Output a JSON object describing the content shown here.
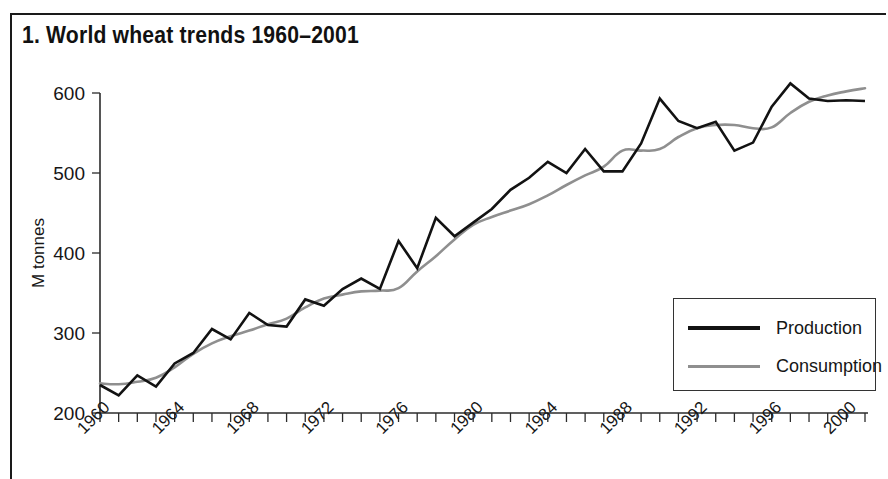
{
  "figure": {
    "title": "1. World wheat trends 1960–2001",
    "border_color": "#1a1a1a",
    "background": "#ffffff"
  },
  "legend": {
    "position": "bottom-right",
    "entries": [
      {
        "label": "Production",
        "color": "#121212",
        "style": "solid"
      },
      {
        "label": "Consumption",
        "color": "#8f8f8f",
        "style": "solid"
      }
    ]
  },
  "chart_data": {
    "type": "line",
    "title": "1. World wheat trends 1960–2001",
    "xlabel": "",
    "ylabel": "M tonnes",
    "xlim": [
      1960,
      2001
    ],
    "ylim": [
      200,
      600
    ],
    "yticks": [
      200,
      300,
      400,
      500,
      600
    ],
    "grid": false,
    "x": [
      1960,
      1961,
      1962,
      1963,
      1964,
      1965,
      1966,
      1967,
      1968,
      1969,
      1970,
      1971,
      1972,
      1973,
      1974,
      1975,
      1976,
      1977,
      1978,
      1979,
      1980,
      1981,
      1982,
      1983,
      1984,
      1985,
      1986,
      1987,
      1988,
      1989,
      1990,
      1991,
      1992,
      1993,
      1994,
      1995,
      1996,
      1997,
      1998,
      1999,
      2000,
      2001
    ],
    "xtick_labels": [
      "1960",
      "1964",
      "1968",
      "1972",
      "1976",
      "1980",
      "1984",
      "1988",
      "1992",
      "1996",
      "2000"
    ],
    "xtick_label_years": [
      1960,
      1964,
      1968,
      1972,
      1976,
      1980,
      1984,
      1988,
      1992,
      1996,
      2000
    ],
    "xtick_label_rotation": 45,
    "minor_xticks_every": 1,
    "series": [
      {
        "name": "Production",
        "color": "#121212",
        "values": [
          235,
          222,
          247,
          233,
          262,
          275,
          305,
          292,
          325,
          310,
          308,
          342,
          334,
          355,
          368,
          355,
          415,
          381,
          444,
          421,
          438,
          455,
          479,
          494,
          514,
          500,
          530,
          502,
          502,
          537,
          593,
          565,
          556,
          564,
          528,
          538,
          583,
          612,
          593,
          590,
          591,
          590
        ]
      },
      {
        "name": "Consumption",
        "color": "#8f8f8f",
        "values": [
          237,
          236,
          239,
          244,
          257,
          274,
          287,
          296,
          303,
          311,
          318,
          332,
          343,
          348,
          352,
          353,
          356,
          377,
          396,
          417,
          435,
          445,
          453,
          461,
          472,
          485,
          497,
          508,
          528,
          528,
          530,
          545,
          556,
          560,
          560,
          556,
          557,
          575,
          589,
          597,
          602,
          606
        ]
      }
    ]
  },
  "axes": {
    "y_axis_label": "M tonnes",
    "y_tick_labels": [
      "600",
      "500",
      "400",
      "300",
      "200"
    ]
  }
}
